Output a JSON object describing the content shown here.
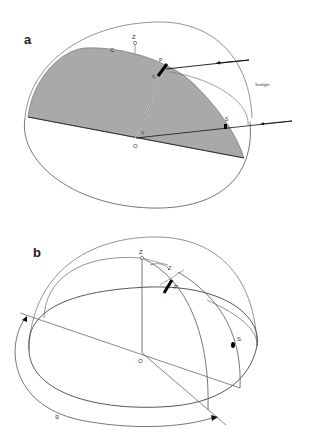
{
  "figure": {
    "panels": [
      {
        "id": "a",
        "label": "a",
        "points": {
          "zenith": "Z",
          "circle": "C",
          "pole": "P",
          "sun": "S",
          "origin": "O"
        },
        "angle_labels": [
          "η",
          "η"
        ],
        "annotation": "Sunlight"
      },
      {
        "id": "b",
        "label": "b",
        "points": {
          "zenith": "Z",
          "pole": "P",
          "sun": "S",
          "origin": "O"
        },
        "angle_labels": {
          "zenith_angle": "Z",
          "azimuth": "Φ"
        }
      }
    ],
    "colors": {
      "background": "#ffffff",
      "line": "#555555",
      "shaded_plane": "#a9a9a9",
      "ink": "#111111"
    }
  }
}
